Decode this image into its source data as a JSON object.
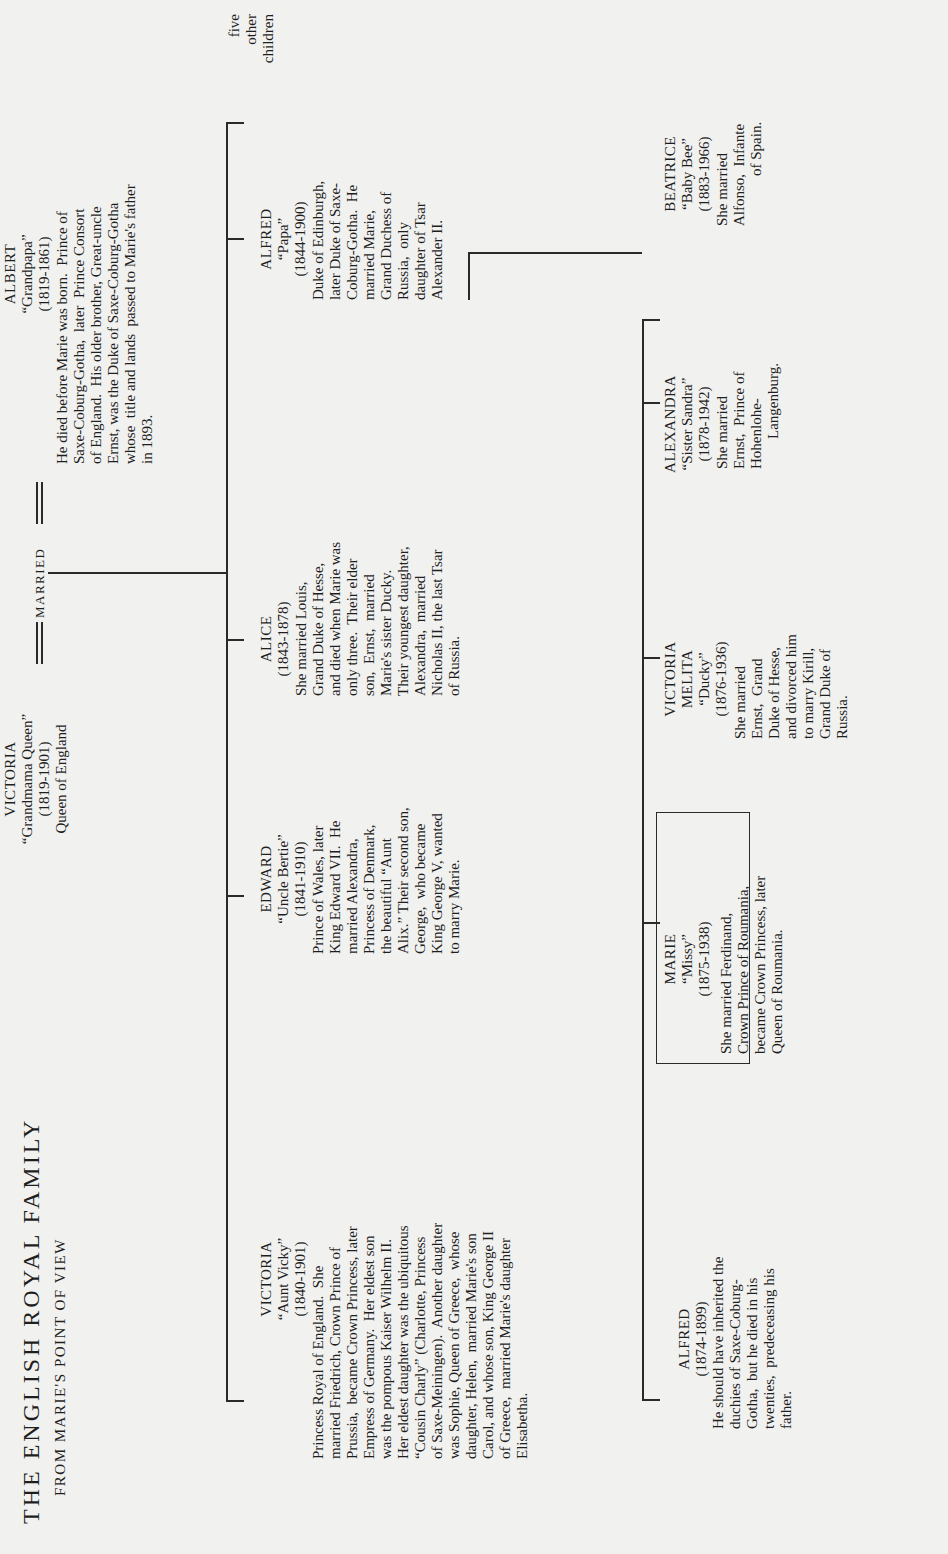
{
  "header": {
    "title": "THE ENGLISH ROYAL FAMILY",
    "subtitle": "FROM MARIE'S POINT OF VIEW"
  },
  "generation1": {
    "victoria": {
      "name": "VICTORIA",
      "nickname": "“Grandmama Queen”",
      "dates": "(1819-1901)",
      "title": "Queen of England"
    },
    "married_label": "MARRIED",
    "albert": {
      "name": "ALBERT",
      "nickname": "“Grandpapa”",
      "dates": "(1819-1861)",
      "desc": [
        "He died before Marie was born.  Prince of",
        "Saxe-Coburg-Gotha,  later  Prince Consort",
        "of England.  His older brother, Great-uncle",
        "Ernst, was the Duke of Saxe-Coburg-Gotha",
        "whose  title and lands  passed to Marie's father",
        "in 1893."
      ]
    }
  },
  "generation2": [
    {
      "name": "VICTORIA",
      "nickname": "“Aunt Vicky”",
      "dates": "(1840-1901)",
      "desc": [
        "Princess Royal of England.  She",
        "married Friedrich, Crown Prince of",
        "Prussia,  became Crown Princess, later",
        "Empress of Germany.  Her eldest son",
        "was the pompous Kaiser Wilhelm II.",
        "Her eldest daughter was the ubiquitous",
        "“Cousin Charly” (Charlotte, Princess",
        "of Saxe-Meiningen).  Another daughter",
        "was Sophie, Queen of Greece,  whose",
        "daughter, Helen,  married Marie's son",
        "Carol, and whose son, King George II",
        "of Greece,  married Marie's daughter",
        "Elisabetha."
      ]
    },
    {
      "name": "EDWARD",
      "nickname": "“Uncle Bertie”",
      "dates": "(1841-1910)",
      "desc": [
        "Prince of Wales, later",
        "King Edward VII.  He",
        "married Alexandra,",
        "Princess of Denmark,",
        "the beautiful “Aunt",
        "Alix.” Their second son,",
        "George,  who became",
        "King George V, wanted",
        "to marry Marie."
      ]
    },
    {
      "name": "ALICE",
      "nickname": "",
      "dates": "(1843-1878)",
      "desc": [
        "She married Louis,",
        "Grand Duke of Hesse,",
        "and died when Marie was",
        "only three.  Their elder",
        "son,  Ernst,  married",
        "Marie's sister Ducky.",
        "Their youngest daughter,",
        "Alexandra,  married",
        "Nicholas II, the last Tsar",
        "of Russia."
      ]
    },
    {
      "name": "ALFRED",
      "nickname": "“Papa”",
      "dates": "(1844-1900)",
      "desc": [
        "Duke of Edinburgh,",
        "later Duke of Saxe-",
        "Coburg-Gotha.  He",
        "married Marie,",
        "Grand Duchess of",
        "Russia,  only",
        "daughter of Tsar",
        "Alexander II."
      ]
    },
    {
      "name": "",
      "desc": [
        "five",
        "other",
        "children"
      ]
    }
  ],
  "generation3": [
    {
      "name": "ALFRED",
      "nickname": "",
      "dates": "(1874-1899)",
      "desc": [
        "He should have inherited the",
        "duchies of Saxe-Coburg-",
        "Gotha,  but he died in his",
        "twenties,  predeceasing his",
        "father."
      ]
    },
    {
      "name": "MARIE",
      "nickname": "“Missy”",
      "dates": "(1875-1938)",
      "highlighted": true,
      "desc": [
        "She married Ferdinand,",
        "Crown Prince of Roumania,",
        "became Crown Princess, later",
        "Queen of Roumania."
      ]
    },
    {
      "name": "VICTORIA",
      "name2": "MELITA",
      "nickname": "“Ducky”",
      "dates": "(1876-1936)",
      "desc": [
        "She married",
        "Ernst,  Grand",
        "Duke of Hesse,",
        "and divorced him",
        "to marry Kirill,",
        "Grand Duke of",
        "Russia."
      ]
    },
    {
      "name": "ALEXANDRA",
      "nickname": "“Sister Sandra”",
      "dates": "(1878-1942)",
      "desc": [
        "She married",
        "Ernst,  Prince of",
        "Hohenlohe-",
        "Langenburg."
      ]
    },
    {
      "name": "BEATRICE",
      "nickname": "“Baby Bee”",
      "dates": "(1883-1966)",
      "desc": [
        "She married",
        "Alfonso,  Infante",
        "of Spain."
      ]
    }
  ]
}
